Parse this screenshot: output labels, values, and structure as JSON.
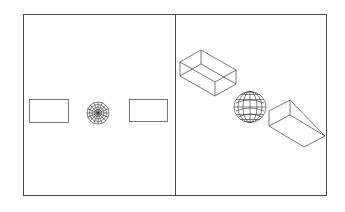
{
  "diagram": {
    "type": "cad-viewports",
    "colors": {
      "background": "#ffffff",
      "frame": "#4a4a4a",
      "lines": "#555555",
      "mesh": "#333333"
    },
    "frame": {
      "x": 23,
      "y": 14,
      "width": 304,
      "height": 182,
      "divider_x": 175
    },
    "viewports": [
      {
        "name": "top-view",
        "objects": [
          {
            "kind": "box-plan",
            "x": 29,
            "y": 99,
            "width": 39,
            "height": 23
          },
          {
            "kind": "sphere-plan",
            "cx": 98,
            "cy": 113,
            "r": 11
          },
          {
            "kind": "wedge-plan",
            "x": 129,
            "y": 99,
            "width": 38,
            "height": 22
          }
        ]
      },
      {
        "name": "isometric-view",
        "objects": [
          {
            "kind": "box-wireframe"
          },
          {
            "kind": "sphere-wireframe",
            "cx": 250,
            "cy": 107,
            "r": 16
          },
          {
            "kind": "wedge-wireframe"
          }
        ]
      }
    ]
  }
}
